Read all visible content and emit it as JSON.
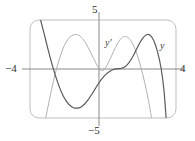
{
  "figure": {
    "kind": "graphing-calculator-viewing-window",
    "frame": {
      "x": 30,
      "y": 20,
      "width": 146,
      "height": 98,
      "corner_radius": 9,
      "border_color": "#b6b6b6"
    },
    "axis_color": "#7a7a7a",
    "background": "#ffffff"
  },
  "labels": {
    "top": "5",
    "bottom": "−5",
    "left": "−4",
    "right": "4",
    "curve_y_prime": "y′",
    "curve_y": "y"
  },
  "chart_data": {
    "type": "line",
    "title": "",
    "xlabel": "",
    "ylabel": "",
    "xlim": [
      -4,
      4
    ],
    "ylim": [
      -5,
      5
    ],
    "xticks": [
      -4,
      4
    ],
    "yticks": [
      -5,
      5
    ],
    "xtick_labels": [
      "−4",
      "4"
    ],
    "ytick_labels": [
      "−5",
      "5"
    ],
    "grid": false,
    "legend_position": "inline-annotation",
    "annotations": [
      {
        "text": "y′",
        "x": 0.35,
        "y": 2.55,
        "series": "y-prime"
      },
      {
        "text": "y",
        "x": 3.15,
        "y": 2.35,
        "series": "y"
      }
    ],
    "series": [
      {
        "name": "y",
        "label": "y",
        "color": "#5a5a5a",
        "width": 1.2,
        "points": [
          {
            "x": -3.2,
            "y": 5.0
          },
          {
            "x": -3.0,
            "y": 3.55
          },
          {
            "x": -2.8,
            "y": 2.05
          },
          {
            "x": -2.6,
            "y": 0.65
          },
          {
            "x": -2.4,
            "y": -0.6
          },
          {
            "x": -2.2,
            "y": -1.7
          },
          {
            "x": -2.0,
            "y": -2.6
          },
          {
            "x": -1.8,
            "y": -3.25
          },
          {
            "x": -1.6,
            "y": -3.7
          },
          {
            "x": -1.4,
            "y": -3.95
          },
          {
            "x": -1.2,
            "y": -4.0
          },
          {
            "x": -1.0,
            "y": -3.9
          },
          {
            "x": -0.8,
            "y": -3.6
          },
          {
            "x": -0.6,
            "y": -3.15
          },
          {
            "x": -0.4,
            "y": -2.6
          },
          {
            "x": -0.2,
            "y": -2.0
          },
          {
            "x": 0.0,
            "y": -1.4
          },
          {
            "x": 0.2,
            "y": -0.9
          },
          {
            "x": 0.4,
            "y": -0.5
          },
          {
            "x": 0.6,
            "y": -0.22
          },
          {
            "x": 0.8,
            "y": -0.05
          },
          {
            "x": 1.0,
            "y": 0.02
          },
          {
            "x": 1.2,
            "y": 0.05
          },
          {
            "x": 1.4,
            "y": 0.2
          },
          {
            "x": 1.6,
            "y": 0.55
          },
          {
            "x": 1.8,
            "y": 1.1
          },
          {
            "x": 2.0,
            "y": 1.8
          },
          {
            "x": 2.2,
            "y": 2.55
          },
          {
            "x": 2.4,
            "y": 3.15
          },
          {
            "x": 2.6,
            "y": 3.5
          },
          {
            "x": 2.8,
            "y": 3.45
          },
          {
            "x": 3.0,
            "y": 2.9
          },
          {
            "x": 3.2,
            "y": 1.8
          },
          {
            "x": 3.4,
            "y": 0.1
          },
          {
            "x": 3.55,
            "y": -2.0
          },
          {
            "x": 3.68,
            "y": -5.0
          }
        ]
      },
      {
        "name": "y-prime",
        "label": "y′",
        "color": "#b0b0b0",
        "width": 1.0,
        "points": [
          {
            "x": -2.92,
            "y": -5.0
          },
          {
            "x": -2.8,
            "y": -3.9
          },
          {
            "x": -2.6,
            "y": -2.1
          },
          {
            "x": -2.4,
            "y": -0.5
          },
          {
            "x": -2.2,
            "y": 0.85
          },
          {
            "x": -2.0,
            "y": 1.95
          },
          {
            "x": -1.8,
            "y": 2.75
          },
          {
            "x": -1.6,
            "y": 3.25
          },
          {
            "x": -1.4,
            "y": 3.48
          },
          {
            "x": -1.25,
            "y": 3.52
          },
          {
            "x": -1.1,
            "y": 3.45
          },
          {
            "x": -0.9,
            "y": 3.1
          },
          {
            "x": -0.7,
            "y": 2.55
          },
          {
            "x": -0.5,
            "y": 1.85
          },
          {
            "x": -0.3,
            "y": 1.1
          },
          {
            "x": -0.1,
            "y": 0.35
          },
          {
            "x": 0.05,
            "y": -0.05
          },
          {
            "x": 0.2,
            "y": -0.15
          },
          {
            "x": 0.35,
            "y": 0.1
          },
          {
            "x": 0.5,
            "y": 0.6
          },
          {
            "x": 0.7,
            "y": 1.4
          },
          {
            "x": 0.9,
            "y": 2.2
          },
          {
            "x": 1.1,
            "y": 2.85
          },
          {
            "x": 1.3,
            "y": 3.25
          },
          {
            "x": 1.5,
            "y": 3.3
          },
          {
            "x": 1.7,
            "y": 3.0
          },
          {
            "x": 1.9,
            "y": 2.35
          },
          {
            "x": 2.1,
            "y": 1.4
          },
          {
            "x": 2.3,
            "y": 0.15
          },
          {
            "x": 2.5,
            "y": -1.35
          },
          {
            "x": 2.7,
            "y": -3.1
          },
          {
            "x": 2.88,
            "y": -5.0
          }
        ]
      }
    ]
  }
}
